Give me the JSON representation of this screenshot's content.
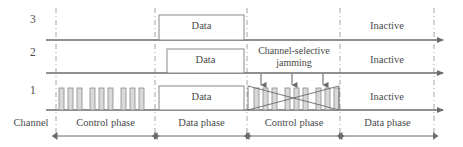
{
  "figure": {
    "type": "timing-diagram"
  },
  "channels": [
    {
      "id": "3",
      "label": "3",
      "axis_y": 40,
      "data_box": {
        "label": "Data",
        "x": 159,
        "width": 85
      },
      "inactive_label": "Inactive"
    },
    {
      "id": "2",
      "label": "2",
      "axis_y": 73,
      "data_box": {
        "label": "Data",
        "x": 167,
        "width": 77
      },
      "inactive_label": "Inactive"
    },
    {
      "id": "1",
      "label": "1",
      "axis_y": 110,
      "data_box": {
        "label": "Data",
        "x": 159,
        "width": 85
      },
      "inactive_label": "Inactive"
    }
  ],
  "annotations": {
    "jamming_line1": "Channel-selective",
    "jamming_line2": "jamming",
    "channel_axis_label": "Channel"
  },
  "phases": [
    {
      "label": "Control phase",
      "start": 56,
      "end": 155
    },
    {
      "label": "Data phase",
      "start": 156,
      "end": 247
    },
    {
      "label": "Control phase",
      "start": 248,
      "end": 340
    },
    {
      "label": "Data phase",
      "start": 341,
      "end": 434
    }
  ],
  "dividers_x": [
    56,
    155,
    247,
    340,
    434
  ],
  "pulse_groups": {
    "left_control": {
      "groups": [
        {
          "x": 59,
          "pulses": 3
        },
        {
          "x": 89,
          "pulses": 3
        },
        {
          "x": 119,
          "pulses": 3
        }
      ],
      "pulse_width": 5,
      "pulse_gap": 4,
      "height": 22
    },
    "right_control": {
      "groups": [
        {
          "x": 254,
          "pulses": 3
        },
        {
          "x": 285,
          "pulses": 3
        },
        {
          "x": 316,
          "pulses": 3
        }
      ],
      "pulse_width": 5,
      "pulse_gap": 4,
      "height": 22
    }
  },
  "jam_arrows_x": [
    261,
    292,
    323
  ],
  "colors": {
    "line": "#6b6b6b",
    "divider": "#9a9a9a",
    "pulse_fill": "#d8d8d8",
    "pulse_stroke": "#8a8a8a",
    "box_stroke": "#8a8a8a",
    "text": "#4a4a4a",
    "background": "#ffffff"
  },
  "axis": {
    "x_start": 46,
    "x_end": 447
  }
}
